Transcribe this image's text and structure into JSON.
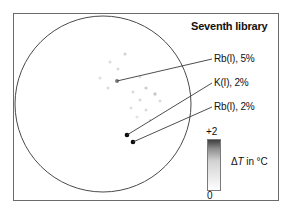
{
  "figure": {
    "title": "Seventh library",
    "frame": {
      "x": 13,
      "y": 13,
      "width": 265,
      "height": 187,
      "stroke": "#6b6b6b"
    },
    "background": "#ffffff"
  },
  "wafer": {
    "name": "wafer-circle",
    "cx": 103,
    "cy": 104,
    "r": 88,
    "stroke": "#4a4a4a"
  },
  "callouts": [
    {
      "label": "Rb(I), 5%",
      "target_x": 117,
      "target_y": 81,
      "text_x": 212,
      "text_y": 59
    },
    {
      "label": "K(I), 2%",
      "target_x": 127,
      "target_y": 135,
      "text_x": 212,
      "text_y": 83
    },
    {
      "label": "Rb(I), 2%",
      "target_x": 133,
      "target_y": 142,
      "text_x": 212,
      "text_y": 107
    }
  ],
  "colorbar": {
    "name": "delta-t-colorbar",
    "max_label": "+2",
    "min_label": "0",
    "axis_label_prefix": "Δ",
    "axis_label_var": "T",
    "axis_label_suffix": " in °C",
    "top_color": "#3a3a3a",
    "bottom_color": "#ffffff",
    "x": 207,
    "y": 139,
    "width": 14,
    "height": 52,
    "stroke": "#7a7a7a"
  },
  "chart_data": {
    "type": "scatter",
    "title": "Seventh library",
    "xlabel": "",
    "ylabel": "",
    "colorbar_label": "ΔT in °C",
    "colorbar_range": [
      0,
      2
    ],
    "grid": false,
    "legend_position": "none",
    "points": [
      {
        "x": 125,
        "y": 54,
        "dt": 0.35,
        "r": 1.6
      },
      {
        "x": 110,
        "y": 62,
        "dt": 0.28,
        "r": 1.5
      },
      {
        "x": 118,
        "y": 69,
        "dt": 0.3,
        "r": 1.5
      },
      {
        "x": 100,
        "y": 78,
        "dt": 0.26,
        "r": 1.5
      },
      {
        "x": 117,
        "y": 81,
        "dt": 1.05,
        "r": 2.0
      },
      {
        "x": 140,
        "y": 77,
        "dt": 0.24,
        "r": 1.5
      },
      {
        "x": 108,
        "y": 88,
        "dt": 0.3,
        "r": 1.5
      },
      {
        "x": 146,
        "y": 88,
        "dt": 0.4,
        "r": 1.6
      },
      {
        "x": 133,
        "y": 92,
        "dt": 0.3,
        "r": 1.5
      },
      {
        "x": 155,
        "y": 94,
        "dt": 0.45,
        "r": 1.7
      },
      {
        "x": 140,
        "y": 100,
        "dt": 0.32,
        "r": 1.5
      },
      {
        "x": 160,
        "y": 101,
        "dt": 0.3,
        "r": 1.5
      },
      {
        "x": 131,
        "y": 108,
        "dt": 0.26,
        "r": 1.5
      },
      {
        "x": 146,
        "y": 110,
        "dt": 0.3,
        "r": 1.5
      },
      {
        "x": 137,
        "y": 117,
        "dt": 0.24,
        "r": 1.5
      },
      {
        "x": 150,
        "y": 120,
        "dt": 0.22,
        "r": 1.5
      },
      {
        "x": 127,
        "y": 135,
        "dt": 2.0,
        "r": 2.3
      },
      {
        "x": 133,
        "y": 142,
        "dt": 2.0,
        "r": 2.3
      }
    ]
  }
}
